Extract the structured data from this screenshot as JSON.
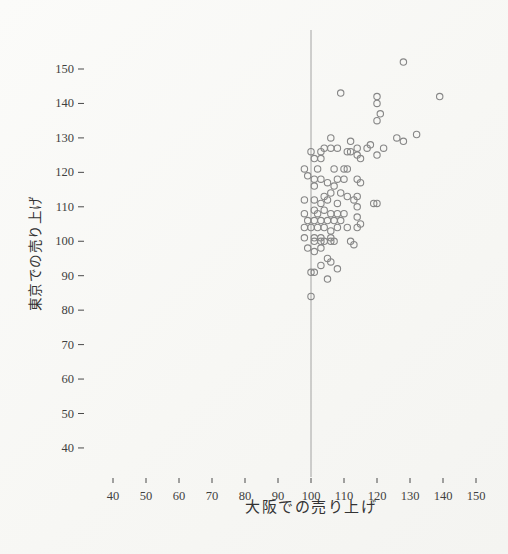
{
  "page": {
    "background": "#fbfbf9",
    "ink_color": "#3f3f3f"
  },
  "chart_data": {
    "type": "scatter",
    "title": "",
    "xlabel": "大阪での売り上げ",
    "ylabel": "東京での売り上げ",
    "xlim": [
      33,
      157
    ],
    "ylim": [
      33,
      157
    ],
    "x_ticks": [
      40,
      50,
      60,
      70,
      80,
      90,
      100,
      110,
      120,
      130,
      140,
      150
    ],
    "y_ticks": [
      40,
      50,
      60,
      70,
      80,
      90,
      100,
      110,
      120,
      130,
      140,
      150
    ],
    "grid": false,
    "legend": null,
    "reference_line": {
      "axis": "x",
      "value": 100,
      "color": "#9a9a9a"
    },
    "marker": {
      "shape": "circle",
      "fill": "none",
      "stroke": "#878787",
      "radius_px": 3.2
    },
    "points": [
      [
        128,
        152
      ],
      [
        109,
        143
      ],
      [
        120,
        142
      ],
      [
        120,
        140
      ],
      [
        139,
        142
      ],
      [
        121,
        137
      ],
      [
        120,
        135
      ],
      [
        106,
        130
      ],
      [
        112,
        129
      ],
      [
        126,
        130
      ],
      [
        128,
        129
      ],
      [
        132,
        131
      ],
      [
        108,
        127
      ],
      [
        104,
        127
      ],
      [
        112,
        126
      ],
      [
        118,
        128
      ],
      [
        122,
        127
      ],
      [
        100,
        126
      ],
      [
        103,
        126
      ],
      [
        106,
        127
      ],
      [
        111,
        126
      ],
      [
        101,
        124
      ],
      [
        103,
        124
      ],
      [
        98,
        121
      ],
      [
        102,
        121
      ],
      [
        107,
        121
      ],
      [
        110,
        121
      ],
      [
        111,
        121
      ],
      [
        99,
        119
      ],
      [
        101,
        118
      ],
      [
        103,
        118
      ],
      [
        105,
        117
      ],
      [
        108,
        118
      ],
      [
        110,
        118
      ],
      [
        101,
        116
      ],
      [
        107,
        116
      ],
      [
        114,
        127
      ],
      [
        117,
        127
      ],
      [
        114,
        125
      ],
      [
        115,
        124
      ],
      [
        120,
        125
      ],
      [
        114,
        118
      ],
      [
        115,
        117
      ],
      [
        104,
        113
      ],
      [
        106,
        114
      ],
      [
        109,
        114
      ],
      [
        111,
        113
      ],
      [
        101,
        112
      ],
      [
        103,
        111
      ],
      [
        105,
        112
      ],
      [
        108,
        111
      ],
      [
        113,
        112
      ],
      [
        101,
        109
      ],
      [
        102,
        108
      ],
      [
        104,
        109
      ],
      [
        106,
        108
      ],
      [
        108,
        108
      ],
      [
        110,
        108
      ],
      [
        99,
        106
      ],
      [
        101,
        106
      ],
      [
        103,
        106
      ],
      [
        105,
        106
      ],
      [
        107,
        106
      ],
      [
        109,
        106
      ],
      [
        98,
        104
      ],
      [
        100,
        104
      ],
      [
        102,
        104
      ],
      [
        104,
        104
      ],
      [
        106,
        103
      ],
      [
        108,
        104
      ],
      [
        111,
        104
      ],
      [
        98,
        101
      ],
      [
        101,
        101
      ],
      [
        103,
        101
      ],
      [
        106,
        101
      ],
      [
        98,
        112
      ],
      [
        98,
        108
      ],
      [
        114,
        113
      ],
      [
        119,
        111
      ],
      [
        120,
        111
      ],
      [
        114,
        110
      ],
      [
        114,
        107
      ],
      [
        115,
        105
      ],
      [
        114,
        104
      ],
      [
        101,
        100
      ],
      [
        103,
        100
      ],
      [
        104,
        100
      ],
      [
        106,
        100
      ],
      [
        107,
        100
      ],
      [
        112,
        100
      ],
      [
        113,
        99
      ],
      [
        99,
        98
      ],
      [
        101,
        97
      ],
      [
        103,
        98
      ],
      [
        105,
        95
      ],
      [
        106,
        94
      ],
      [
        103,
        93
      ],
      [
        101,
        91
      ],
      [
        100,
        91
      ],
      [
        108,
        92
      ],
      [
        105,
        89
      ],
      [
        100,
        84
      ]
    ]
  }
}
